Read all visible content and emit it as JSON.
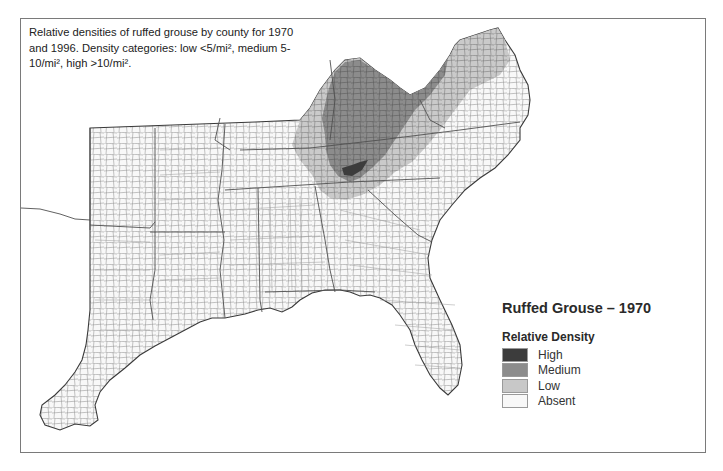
{
  "figure": {
    "caption_lines": [
      "Relative densities of ruffed grouse by county for 1970",
      "and 1996. Density categories: low <5/mi², medium 5-",
      "10/mi², high >10/mi²."
    ],
    "legend": {
      "title": "Ruffed Grouse – 1970",
      "subtitle": "Relative Density",
      "items": [
        {
          "label": "High",
          "color": "#3c3c3c"
        },
        {
          "label": "Medium",
          "color": "#8c8c8c"
        },
        {
          "label": "Low",
          "color": "#c8c8c8"
        },
        {
          "label": "Absent",
          "color": "#f8f8f8"
        }
      ]
    },
    "colors": {
      "frame": "#7a7a7a",
      "county_line": "#8a8a8a",
      "state_line": "#505050",
      "coast_line": "#3a3a3a"
    }
  }
}
